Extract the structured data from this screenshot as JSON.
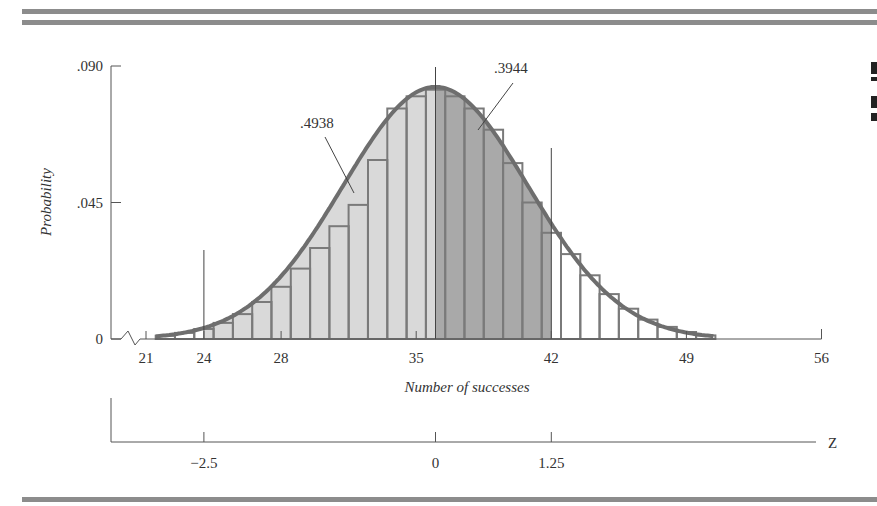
{
  "chart_data": {
    "type": "bar",
    "xlabel": "Number of successes",
    "ylabel": "Probability",
    "x_ticks": [
      21,
      24,
      28,
      35,
      42,
      49,
      56
    ],
    "x_tick_labels": [
      "21",
      "24",
      "28",
      "35",
      "42",
      "49",
      "56"
    ],
    "xlim": [
      21,
      56
    ],
    "y_ticks": [
      0,
      0.045,
      0.09
    ],
    "y_tick_labels": [
      "0",
      ".045",
      ".090"
    ],
    "ylim": [
      0,
      0.09
    ],
    "axis_break": true,
    "normal_curve": {
      "mean": 36,
      "sd": 4.8
    },
    "categories": [
      22,
      23,
      24,
      25,
      26,
      27,
      28,
      29,
      30,
      31,
      32,
      33,
      34,
      35,
      36,
      37,
      38,
      39,
      40,
      41,
      42,
      43,
      44,
      45,
      46,
      47,
      48,
      49,
      50
    ],
    "values": [
      0.0011,
      0.002,
      0.0033,
      0.0053,
      0.0082,
      0.0122,
      0.0172,
      0.0232,
      0.03,
      0.0372,
      0.0442,
      0.059,
      0.076,
      0.08,
      0.0822,
      0.08,
      0.076,
      0.069,
      0.058,
      0.045,
      0.035,
      0.028,
      0.021,
      0.0148,
      0.01,
      0.0064,
      0.004,
      0.0023,
      0.0012
    ],
    "shaded_regions": [
      {
        "from": 24,
        "to": 36,
        "area_label": ".4938",
        "shade": "light"
      },
      {
        "from": 36,
        "to": 42,
        "area_label": ".3944",
        "shade": "dark"
      }
    ],
    "reference_lines": [
      24,
      36,
      42
    ],
    "z_axis": {
      "label": "Z",
      "ticks": [
        -2.5,
        0,
        1.25
      ],
      "tick_labels": [
        "−2.5",
        "0",
        "1.25"
      ],
      "tick_x_values": [
        24,
        36,
        42
      ]
    },
    "colors": {
      "curve": "#6e6e6e",
      "bar_outline": "#7a7a7a",
      "light_fill": "#d9d9d9",
      "dark_fill": "#a9a9a9",
      "axis": "#555555",
      "rule": "#8c8c8c"
    }
  }
}
